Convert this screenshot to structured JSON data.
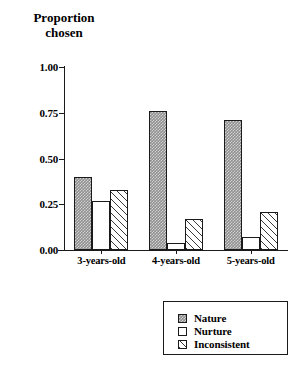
{
  "chart_data": {
    "type": "bar",
    "title": "",
    "ylabel": "Proportion\nchosen",
    "xlabel": "",
    "categories": [
      "3-years-old",
      "4-years-old",
      "5-years-old"
    ],
    "series": [
      {
        "name": "Nature",
        "values": [
          0.4,
          0.76,
          0.71
        ],
        "pattern": "checkered",
        "color": "#8f8f8f"
      },
      {
        "name": "Nurture",
        "values": [
          0.27,
          0.04,
          0.07
        ],
        "pattern": "dotted",
        "color": "#ffffff"
      },
      {
        "name": "Inconsistent",
        "values": [
          0.33,
          0.17,
          0.21
        ],
        "pattern": "diagonal-hatch",
        "color": "#ffffff"
      }
    ],
    "ylim": [
      0.0,
      1.0
    ],
    "yticks": [
      "0.00",
      "0.25",
      "0.50",
      "0.75",
      "1.00"
    ],
    "ytick_values": [
      0.0,
      0.25,
      0.5,
      0.75,
      1.0
    ],
    "grid": false,
    "legend_position": "bottom-right"
  },
  "axis": {
    "y_title": "Proportion\nchosen"
  },
  "legend": {
    "entries": [
      {
        "label": "Nature"
      },
      {
        "label": "Nurture"
      },
      {
        "label": "Inconsistent"
      }
    ]
  }
}
